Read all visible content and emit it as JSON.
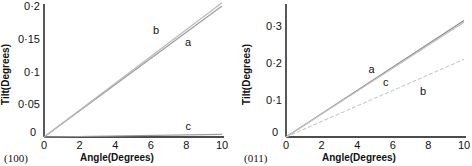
{
  "chart_data": [
    {
      "type": "line",
      "panel_label": "(100)",
      "title": "",
      "xlabel": "Angle(Degrees)",
      "ylabel": "Tilt(Degrees)",
      "xlim": [
        0,
        10
      ],
      "ylim": [
        0,
        0.2
      ],
      "x_ticks": [
        "0",
        "2",
        "4",
        "6",
        "8",
        "10"
      ],
      "y_ticks": [
        "0",
        "0·05",
        "0·1",
        "0·15",
        "0·2"
      ],
      "grid": false,
      "legend": "inline labels",
      "series": [
        {
          "name": "a",
          "x": [
            0,
            10
          ],
          "values": [
            0,
            0.2
          ]
        },
        {
          "name": "b",
          "x": [
            0,
            10
          ],
          "values": [
            0,
            0.205
          ]
        },
        {
          "name": "c",
          "x": [
            0,
            10
          ],
          "values": [
            0,
            0.004
          ]
        }
      ],
      "labels": [
        {
          "text": "b",
          "x": 6.3,
          "y": 0.163
        },
        {
          "text": "a",
          "x": 8.1,
          "y": 0.145
        },
        {
          "text": "c",
          "x": 8.1,
          "y": 0.017
        }
      ]
    },
    {
      "type": "line",
      "panel_label": "(011)",
      "title": "",
      "xlabel": "Angle(Degrees)",
      "ylabel": "Tilt(Degrees)",
      "xlim": [
        0,
        10
      ],
      "ylim": [
        0,
        0.35
      ],
      "x_ticks": [
        "0",
        "2",
        "4",
        "6",
        "8",
        "10"
      ],
      "y_ticks": [
        "0",
        "0·1",
        "0·2",
        "0·3"
      ],
      "grid": false,
      "legend": "inline labels",
      "series": [
        {
          "name": "a",
          "x": [
            0,
            10
          ],
          "values": [
            0,
            0.315
          ]
        },
        {
          "name": "c",
          "x": [
            0,
            10
          ],
          "values": [
            0,
            0.31
          ]
        },
        {
          "name": "b",
          "x": [
            0,
            10
          ],
          "values": [
            0,
            0.21
          ]
        }
      ],
      "labels": [
        {
          "text": "a",
          "x": 4.8,
          "y": 0.185
        },
        {
          "text": "c",
          "x": 5.6,
          "y": 0.148
        },
        {
          "text": "b",
          "x": 7.7,
          "y": 0.125
        }
      ]
    }
  ]
}
